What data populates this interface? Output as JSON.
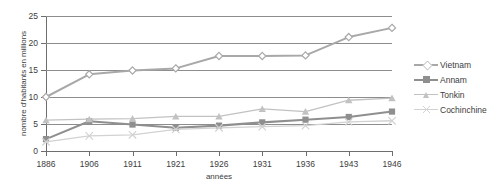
{
  "chart_data": {
    "type": "line",
    "title": "",
    "xlabel": "années",
    "ylabel": "nombre d'habitants en millions",
    "categories": [
      "1886",
      "1906",
      "1911",
      "1921",
      "1926",
      "1931",
      "1936",
      "1943",
      "1946"
    ],
    "ylim": [
      0,
      25
    ],
    "yticks": [
      0,
      5,
      10,
      15,
      20,
      25
    ],
    "grid": true,
    "legend_position": "right",
    "series": [
      {
        "name": "Vietnam",
        "color": "#a8a8a8",
        "marker": "diamond",
        "values": [
          10.0,
          14.2,
          14.9,
          15.3,
          17.6,
          17.6,
          17.7,
          21.1,
          22.8
        ]
      },
      {
        "name": "Annam",
        "color": "#8f8f8f",
        "marker": "square",
        "values": [
          2.2,
          5.5,
          4.9,
          4.3,
          4.7,
          5.3,
          5.8,
          6.3,
          7.3
        ]
      },
      {
        "name": "Tonkin",
        "color": "#c2c2c2",
        "marker": "triangle",
        "values": [
          5.7,
          5.9,
          6.0,
          6.4,
          6.4,
          7.8,
          7.3,
          9.4,
          9.8
        ]
      },
      {
        "name": "Cochinchine",
        "color": "#d2d2d2",
        "marker": "cross",
        "values": [
          1.7,
          2.8,
          3.0,
          4.0,
          4.3,
          4.5,
          4.7,
          5.4,
          5.6
        ]
      }
    ]
  },
  "axes": {
    "y_tick_labels": [
      "0",
      "5",
      "10",
      "15",
      "20",
      "25"
    ],
    "x_tick_labels": [
      "1886",
      "1906",
      "1911",
      "1921",
      "1926",
      "1931",
      "1936",
      "1943",
      "1946"
    ],
    "y_axis_title": "nombre d'habitants en millions",
    "x_axis_title": "années"
  },
  "legend": {
    "entries": [
      {
        "label": "Vietnam"
      },
      {
        "label": "Annam"
      },
      {
        "label": "Tonkin"
      },
      {
        "label": "Cochinchine"
      }
    ]
  },
  "colors": {
    "axis": "#6e6e6e",
    "grid": "#8d8d8d",
    "text": "#3d3d3d",
    "background": "#ffffff"
  }
}
